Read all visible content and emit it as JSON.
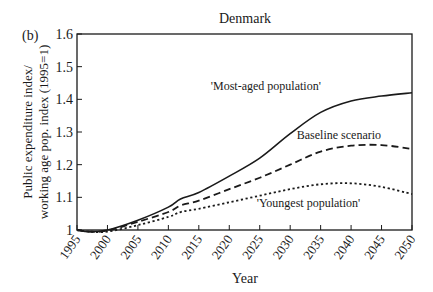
{
  "panel_label": "(b)",
  "chart_data": {
    "type": "line",
    "title": "Denmark",
    "xlabel": "Year",
    "ylabel_line1": "Public expenditure index/",
    "ylabel_line2": "working age pop. index (1995=1)",
    "xlim": [
      1995,
      2050
    ],
    "ylim": [
      1.0,
      1.6
    ],
    "grid": false,
    "legend": "inline annotations",
    "x_ticks": [
      1995,
      2000,
      2005,
      2010,
      2015,
      2020,
      2025,
      2030,
      2035,
      2040,
      2045,
      2050
    ],
    "y_ticks": [
      1,
      1.1,
      1.2,
      1.3,
      1.4,
      1.5,
      1.6
    ],
    "y_tick_labels": [
      "1",
      "1.1",
      "1.2",
      "1.3",
      "1.4",
      "1.5",
      "1.6"
    ],
    "x": [
      1995,
      1997,
      2000,
      2005,
      2010,
      2012,
      2015,
      2020,
      2025,
      2030,
      2035,
      2040,
      2045,
      2050
    ],
    "series": [
      {
        "name": "'Most-aged population'",
        "style": "solid",
        "values": [
          1.0,
          0.995,
          1.0,
          1.03,
          1.07,
          1.095,
          1.115,
          1.165,
          1.22,
          1.295,
          1.36,
          1.395,
          1.41,
          1.42
        ]
      },
      {
        "name": "Baseline scenario",
        "style": "dashed",
        "values": [
          1.0,
          0.995,
          0.998,
          1.025,
          1.055,
          1.075,
          1.09,
          1.125,
          1.16,
          1.2,
          1.24,
          1.258,
          1.26,
          1.248
        ]
      },
      {
        "name": "'Youngest population'",
        "style": "dotted",
        "values": [
          1.0,
          0.995,
          0.995,
          1.015,
          1.04,
          1.055,
          1.065,
          1.085,
          1.105,
          1.125,
          1.14,
          1.143,
          1.132,
          1.11
        ]
      }
    ],
    "annotations": [
      {
        "text": "'Most-aged population'",
        "x": 2026,
        "y": 1.43
      },
      {
        "text": "Baseline scenario",
        "x": 2038,
        "y": 1.28
      },
      {
        "text": "'Youngest population'",
        "x": 2033,
        "y": 1.07
      }
    ]
  }
}
